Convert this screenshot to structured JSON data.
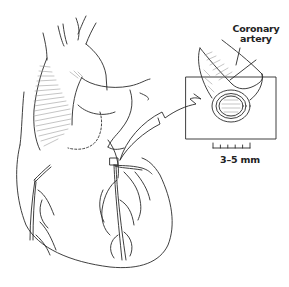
{
  "figure": {
    "labels": {
      "artery_line1": "Coronary",
      "artery_line2": "artery",
      "scale": "3–5 mm"
    },
    "parts": {
      "heart": "heart",
      "aorta": "aorta",
      "left_coronary": "left coronary artery branches",
      "right_coronary": "right coronary artery branches",
      "inset": "magnified coronary artery",
      "arrow": "magnification arrow",
      "scale_bar": "scale bar"
    },
    "scale_ticks": 6,
    "colors": {
      "ink": "#2a2a2a",
      "background": "#ffffff",
      "hatch": "#8a8a8a"
    }
  }
}
